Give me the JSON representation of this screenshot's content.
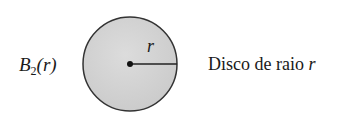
{
  "diagram": {
    "left_label": {
      "symbol": "B",
      "subscript": "2",
      "argument": "(r)"
    },
    "radius_label": "r",
    "right_label": {
      "text": "Disco de raio ",
      "variable": "r"
    },
    "disc": {
      "cx": 130,
      "cy": 64,
      "radius": 47,
      "fill": "#d4d4d4",
      "stroke": "#333333"
    }
  }
}
